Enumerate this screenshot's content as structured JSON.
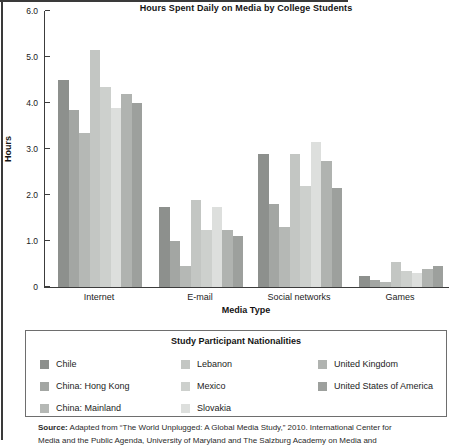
{
  "chart_data": {
    "type": "bar",
    "title": "Hours Spent Daily on Media by College Students",
    "xlabel": "Media Type",
    "ylabel": "Hours",
    "ylim": [
      0,
      6.0
    ],
    "ytick_labels": [
      "6.0",
      "5.0",
      "4.0",
      "3.0",
      "2.0",
      "1.0",
      "0"
    ],
    "grid": false,
    "categories": [
      "Internet",
      "E-mail",
      "Social networks",
      "Games"
    ],
    "series": [
      {
        "name": "Chile",
        "color": "#8d908d",
        "values": [
          4.5,
          1.75,
          2.9,
          0.25
        ]
      },
      {
        "name": "China: Hong Kong",
        "color": "#a3a6a3",
        "values": [
          3.85,
          1.0,
          1.8,
          0.15
        ]
      },
      {
        "name": "China: Mainland",
        "color": "#b5b8b5",
        "values": [
          3.35,
          0.45,
          1.3,
          0.1
        ]
      },
      {
        "name": "Lebanon",
        "color": "#c3c6c3",
        "values": [
          5.15,
          1.9,
          2.9,
          0.55
        ]
      },
      {
        "name": "Mexico",
        "color": "#cdd0cd",
        "values": [
          4.35,
          1.25,
          2.2,
          0.35
        ]
      },
      {
        "name": "Slovakia",
        "color": "#dddfdd",
        "values": [
          3.9,
          1.75,
          3.15,
          0.3
        ]
      },
      {
        "name": "United Kingdom",
        "color": "#b0b3b0",
        "values": [
          4.2,
          1.25,
          2.75,
          0.4
        ]
      },
      {
        "name": "United States of America",
        "color": "#9da09d",
        "values": [
          4.0,
          1.1,
          2.15,
          0.45
        ]
      }
    ],
    "legend_title": "Study Participant Nationalities",
    "legend_position": "bottom"
  },
  "source": {
    "label": "Source:",
    "text": " Adapted from “The World Unplugged: A Global Media Study,” 2010. International Center for",
    "text_line2": "Media and the Public Agenda, University of Maryland and The Salzburg Academy on Media and"
  }
}
